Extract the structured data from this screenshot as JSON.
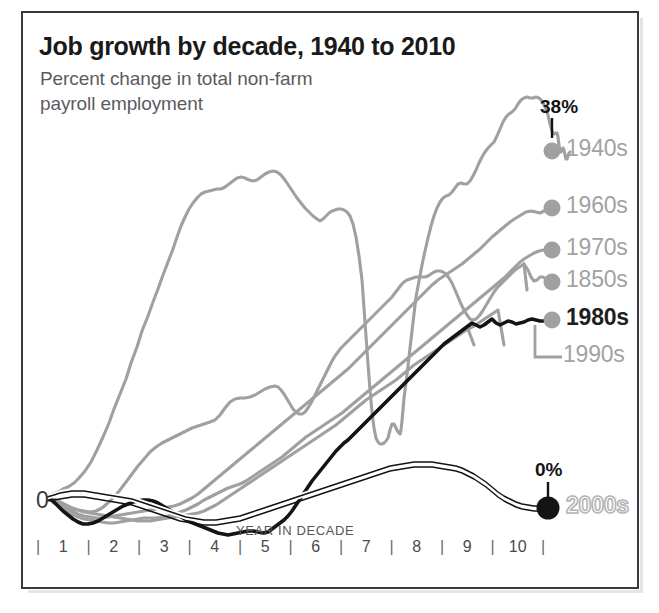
{
  "header": {
    "title": "Job growth by decade, 1940 to 2010",
    "subtitle": "Percent change in total non-farm\npayroll employment"
  },
  "axes": {
    "y_zero_label": "0",
    "x_axis_title": "YEAR IN DECADE",
    "x_tick_labels": [
      "1",
      "2",
      "3",
      "4",
      "5",
      "6",
      "7",
      "8",
      "9",
      "10"
    ],
    "tick_mark_glyph": "|"
  },
  "annotations": {
    "top_value": "38%",
    "bottom_value": "0%"
  },
  "legend": {
    "items": [
      {
        "label": "1940s",
        "style": "gray"
      },
      {
        "label": "1960s",
        "style": "gray"
      },
      {
        "label": "1970s",
        "style": "gray"
      },
      {
        "label": "1850s",
        "style": "gray"
      },
      {
        "label": "1980s",
        "style": "dark"
      },
      {
        "label": "1990s",
        "style": "gray"
      },
      {
        "label": "2000s",
        "style": "outline"
      }
    ]
  },
  "colors": {
    "gray_line": "#a0a0a2",
    "dark_line": "#141416",
    "frame": "#3a3a3e",
    "title_text": "#1a1a1a",
    "subtitle_text": "#5b5b5f",
    "background": "#ffffff"
  },
  "chart_data": {
    "type": "line",
    "title": "Job growth by decade, 1940 to 2010",
    "subtitle": "Percent change in total non-farm payroll employment",
    "xlabel": "YEAR IN DECADE",
    "ylabel": "Percent change in total non-farm payroll employment",
    "x": [
      0,
      1,
      2,
      3,
      4,
      5,
      6,
      7,
      8,
      9,
      10
    ],
    "xlim": [
      0,
      10
    ],
    "ylim": [
      -4,
      40
    ],
    "grid": false,
    "legend_position": "right-end-of-line",
    "ytick_labels": [
      "0"
    ],
    "annotations": [
      {
        "text": "38%",
        "series": "1940s",
        "x": 10,
        "y": 38
      },
      {
        "text": "0%",
        "series": "2000s",
        "x": 10,
        "y": 0
      }
    ],
    "series": [
      {
        "name": "1940s",
        "color": "#a0a0a2",
        "emphasis": false,
        "end_value": 38,
        "values": [
          0,
          5.5,
          14.5,
          21.5,
          21.0,
          18.5,
          11.0,
          21.5,
          29.0,
          35.0,
          38.0
        ]
      },
      {
        "name": "1960s",
        "color": "#a0a0a2",
        "emphasis": false,
        "end_value": 31,
        "values": [
          0,
          1.5,
          4.0,
          7.0,
          10.5,
          14.5,
          18.5,
          22.0,
          25.0,
          28.5,
          31.0
        ]
      },
      {
        "name": "1970s",
        "color": "#a0a0a2",
        "emphasis": false,
        "end_value": 27,
        "values": [
          0,
          1.0,
          2.5,
          6.0,
          9.0,
          11.5,
          14.0,
          17.5,
          21.5,
          25.0,
          27.0
        ]
      },
      {
        "name": "1850s",
        "color": "#a0a0a2",
        "emphasis": false,
        "end_value": 24,
        "values": [
          0,
          2.5,
          7.5,
          9.5,
          14.0,
          18.0,
          20.5,
          20.0,
          17.0,
          21.0,
          24.0
        ]
      },
      {
        "name": "1980s",
        "color": "#141416",
        "emphasis": true,
        "end_value": 21,
        "values": [
          0,
          -1.5,
          0.5,
          -1.5,
          -3.0,
          1.0,
          6.5,
          10.5,
          14.0,
          17.5,
          21.0
        ]
      },
      {
        "name": "1990s",
        "color": "#a0a0a2",
        "emphasis": false,
        "end_value": 20.5,
        "values": [
          0,
          -0.5,
          0.5,
          1.5,
          4.0,
          7.0,
          10.0,
          13.5,
          16.0,
          18.5,
          20.5
        ]
      },
      {
        "name": "2000s",
        "color": "#141416",
        "emphasis": false,
        "end_value": 0,
        "values": [
          0,
          0.5,
          0.0,
          -0.5,
          0.5,
          2.5,
          4.5,
          6.0,
          6.3,
          4.0,
          0.0
        ]
      }
    ]
  }
}
